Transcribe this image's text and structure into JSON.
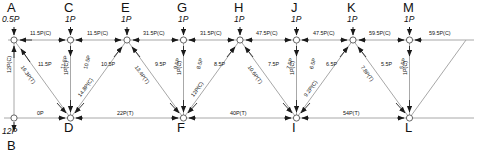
{
  "diagram": {
    "type": "truss-force-diagram",
    "units_note": "P",
    "colors": {
      "member": "#9a9a9a",
      "arrow": "#1a1a1a",
      "text": "#111111",
      "background": "#ffffff"
    },
    "geometry": {
      "top_chord_y": 40,
      "bottom_chord_y": 118,
      "panel_width": 56.5,
      "left_x": 14
    }
  },
  "nodes": {
    "top": [
      {
        "id": "A",
        "x": 14,
        "label": "A"
      },
      {
        "id": "C",
        "x": 70.5,
        "label": "C"
      },
      {
        "id": "E",
        "x": 127,
        "label": "E"
      },
      {
        "id": "G",
        "x": 183.5,
        "label": "G"
      },
      {
        "id": "H",
        "x": 240,
        "label": "H"
      },
      {
        "id": "J",
        "x": 296.5,
        "label": "J"
      },
      {
        "id": "K",
        "x": 353,
        "label": "K"
      },
      {
        "id": "M",
        "x": 409.5,
        "label": "M"
      }
    ],
    "bottom": [
      {
        "id": "B",
        "x": 14,
        "label": "B"
      },
      {
        "id": "D",
        "x": 70.5,
        "label": "D"
      },
      {
        "id": "F",
        "x": 183.5,
        "label": "F"
      },
      {
        "id": "I",
        "x": 296.5,
        "label": "I"
      },
      {
        "id": "L",
        "x": 409.5,
        "label": "L"
      }
    ]
  },
  "applied_loads": [
    {
      "at": "A",
      "value": "0.5P",
      "x": 14,
      "arrow": "down"
    },
    {
      "at": "C",
      "value": "1P",
      "x": 70.5,
      "arrow": "down"
    },
    {
      "at": "E",
      "value": "1P",
      "x": 127,
      "arrow": "down"
    },
    {
      "at": "G",
      "value": "1P",
      "x": 183.5,
      "arrow": "down"
    },
    {
      "at": "H",
      "value": "1P",
      "x": 240,
      "arrow": "down"
    },
    {
      "at": "J",
      "value": "1P",
      "x": 296.5,
      "arrow": "down"
    },
    {
      "at": "K",
      "value": "1P",
      "x": 353,
      "arrow": "down"
    },
    {
      "at": "M",
      "value": "1P",
      "x": 409.5,
      "arrow": "down"
    },
    {
      "at": "B",
      "value": "12P",
      "x": 14,
      "arrow": "down"
    }
  ],
  "top_chord_forces": [
    {
      "from": "A",
      "to": "C",
      "value": "11.5P(C)",
      "x": 41,
      "y": 45
    },
    {
      "from": "C",
      "to": "E",
      "value": "11.5P(C)",
      "x": 97,
      "y": 45
    },
    {
      "from": "E",
      "to": "G",
      "value": "31.5P(C)",
      "x": 154,
      "y": 45
    },
    {
      "from": "G",
      "to": "H",
      "value": "31.5P(C)",
      "x": 210,
      "y": 45
    },
    {
      "from": "H",
      "to": "J",
      "value": "47.5P(C)",
      "x": 267,
      "y": 45
    },
    {
      "from": "J",
      "to": "K",
      "value": "47.5P(C)",
      "x": 323,
      "y": 45
    },
    {
      "from": "K",
      "to": "M",
      "value": "59.5P(C)",
      "x": 380,
      "y": 45
    },
    {
      "from": "M",
      "to": "end",
      "value": "59.5P(C)",
      "x": 436,
      "y": 45
    }
  ],
  "bottom_chord_forces": [
    {
      "from": "B",
      "to": "D",
      "value": "0P",
      "x": 42,
      "y": 118
    },
    {
      "from": "D",
      "to": "F",
      "value": "22P(T)",
      "x": 127,
      "y": 118
    },
    {
      "from": "F",
      "to": "I",
      "value": "40P(T)",
      "x": 240,
      "y": 118
    },
    {
      "from": "I",
      "to": "L",
      "value": "54P(T)",
      "x": 353,
      "y": 118
    }
  ],
  "vertical_forces": [
    {
      "member": "A-B",
      "value": "12P(C)",
      "x": 14,
      "rotated": true
    },
    {
      "member": "C-D",
      "value": "1P(C)",
      "x": 70.5,
      "rotated": true
    },
    {
      "member": "E-F",
      "value": "1P(C)",
      "x": 183.5,
      "rotated": true
    },
    {
      "member": "H-I",
      "value": "1P(C)",
      "x": 296.5,
      "rotated": true
    },
    {
      "member": "K-L",
      "value": "1P(C)",
      "x": 409.5,
      "rotated": true
    }
  ],
  "diagonal_forces": [
    {
      "member": "A-D",
      "value": "16.3P(T)",
      "kind": "tension"
    },
    {
      "member": "D-E",
      "value": "14.8P(C)",
      "kind": "compression"
    },
    {
      "member": "E-F",
      "value": "13.4P(T)",
      "kind": "tension"
    },
    {
      "member": "F-H",
      "value": "12P(C)",
      "kind": "compression"
    },
    {
      "member": "H-I",
      "value": "10.6P(T)",
      "kind": "tension"
    },
    {
      "member": "I-K",
      "value": "9.2P(C)",
      "kind": "compression"
    },
    {
      "member": "K-L",
      "value": "7.8P(T)",
      "kind": "tension"
    }
  ],
  "joint_components": [
    {
      "label": "11.5P",
      "x": 38,
      "y": 67,
      "rot": 0
    },
    {
      "label": "11.5P",
      "x": 62,
      "y": 70,
      "rot": 74
    },
    {
      "label": "10.5P",
      "x": 88,
      "y": 70,
      "rot": 74
    },
    {
      "label": "10.5P",
      "x": 106,
      "y": 67,
      "rot": 0
    },
    {
      "label": "9.5P",
      "x": 160,
      "y": 67,
      "rot": 0
    },
    {
      "label": "9.5P",
      "x": 176,
      "y": 70,
      "rot": 74
    },
    {
      "label": "8.5P",
      "x": 199,
      "y": 70,
      "rot": 74
    },
    {
      "label": "8.5P",
      "x": 218,
      "y": 67,
      "rot": 0
    },
    {
      "label": "7.5P",
      "x": 272,
      "y": 67,
      "rot": 0
    },
    {
      "label": "7.5P",
      "x": 289,
      "y": 70,
      "rot": 74
    },
    {
      "label": "6.5P",
      "x": 312,
      "y": 70,
      "rot": 74
    },
    {
      "label": "6.5P",
      "x": 330,
      "y": 67,
      "rot": 0
    },
    {
      "label": "5.5P",
      "x": 385,
      "y": 67,
      "rot": 0
    },
    {
      "label": "5.5P",
      "x": 402,
      "y": 70,
      "rot": 74
    }
  ]
}
